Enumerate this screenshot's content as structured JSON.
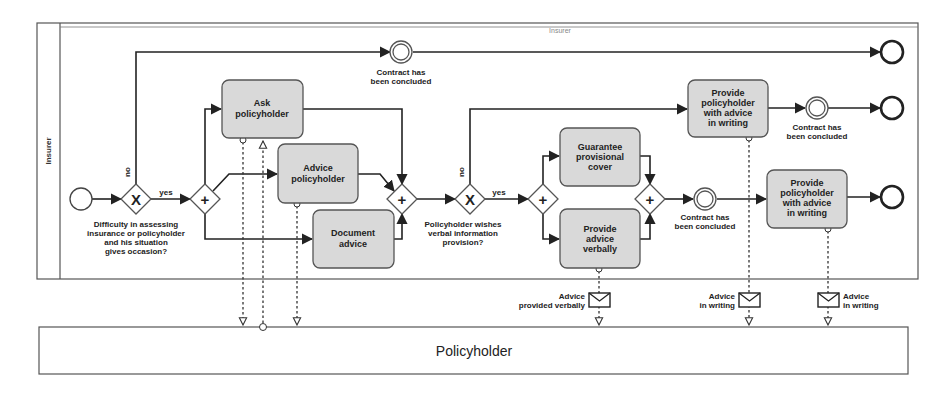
{
  "diagram": {
    "type": "BPMN collaboration",
    "header_label": "Insurer",
    "lanes": {
      "insurer": {
        "label": "Insurer"
      },
      "policyholder": {
        "label": "Policyholder"
      }
    },
    "gateways": {
      "xor1": {
        "type": "exclusive",
        "symbol": "X",
        "question": [
          "Difficulty in assessing",
          "insurance or policyholder",
          "and his situation",
          "gives occasion?"
        ],
        "yes_label": "yes",
        "no_label": "no"
      },
      "and1": {
        "type": "parallel",
        "symbol": "+"
      },
      "and2": {
        "type": "parallel",
        "symbol": "+"
      },
      "xor2": {
        "type": "exclusive",
        "symbol": "X",
        "question": [
          "Policyholder wishes",
          "verbal information",
          "provision?"
        ],
        "yes_label": "yes",
        "no_label": "no"
      },
      "and3": {
        "type": "parallel",
        "symbol": "+"
      },
      "and4": {
        "type": "parallel",
        "symbol": "+"
      }
    },
    "tasks": {
      "ask": [
        "Ask",
        "policyholder"
      ],
      "advice": [
        "Advice",
        "policyholder"
      ],
      "document": [
        "Document",
        "advice"
      ],
      "guarantee": [
        "Guarantee",
        "provisional",
        "cover"
      ],
      "verbally": [
        "Provide",
        "advice",
        "verbally"
      ],
      "writing_upper": [
        "Provide",
        "policyholder",
        "with advice",
        "in writing"
      ],
      "writing_lower": [
        "Provide",
        "policyholder",
        "with advice",
        "in writing"
      ]
    },
    "events": {
      "contract1": [
        "Contract has",
        "been concluded"
      ],
      "contract2": [
        "Contract has",
        "been concluded"
      ],
      "contract3": [
        "Contract has",
        "been concluded"
      ]
    },
    "messages": {
      "verbal": [
        "Advice",
        "provided verbally"
      ],
      "writing1": [
        "Advice",
        "in writing"
      ],
      "writing2": [
        "Advice",
        "in writing"
      ]
    }
  }
}
